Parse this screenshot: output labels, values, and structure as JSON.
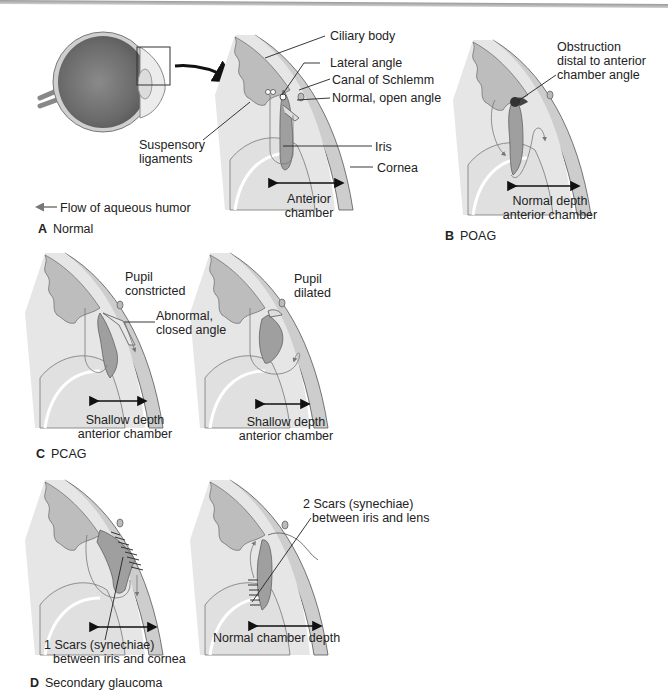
{
  "figure": {
    "panels": [
      {
        "letter": "A",
        "title": "Normal",
        "labels": {
          "ciliary_body": "Ciliary body",
          "lateral_angle": "Lateral angle",
          "canal_of_schlemm": "Canal of Schlemm",
          "normal_open_angle": "Normal, open angle",
          "suspensory_ligaments_1": "Suspensory",
          "suspensory_ligaments_2": "ligaments",
          "iris": "Iris",
          "cornea": "Cornea",
          "anterior_chamber_1": "Anterior",
          "anterior_chamber_2": "chamber"
        },
        "legend": "Flow of aqueous humor"
      },
      {
        "letter": "B",
        "title": "POAG",
        "labels": {
          "obstruction_1": "Obstruction",
          "obstruction_2": "distal to anterior",
          "obstruction_3": "chamber angle",
          "depth_1": "Normal depth",
          "depth_2": "anterior chamber"
        }
      },
      {
        "letter": "C",
        "title": "PCAG",
        "labels": {
          "pupil_constricted_1": "Pupil",
          "pupil_constricted_2": "constricted",
          "closed_angle_1": "Abnormal,",
          "closed_angle_2": "closed angle",
          "shallow_left_1": "Shallow depth",
          "shallow_left_2": "anterior chamber",
          "pupil_dilated_1": "Pupil",
          "pupil_dilated_2": "dilated",
          "shallow_right_1": "Shallow depth",
          "shallow_right_2": "anterior chamber"
        }
      },
      {
        "letter": "D",
        "title": "Secondary glaucoma",
        "labels": {
          "scars1_1": "1 Scars (synechiae)",
          "scars1_2": "between iris and cornea",
          "scars2_1": "2 Scars (synechiae)",
          "scars2_2": "between iris and lens",
          "normal_depth": "Normal chamber depth"
        }
      }
    ],
    "colors": {
      "tissue": "#d9d9d9",
      "cornea": "#c8c8c8",
      "iris": "#9a9a9a",
      "lens": "#e6e6e6",
      "line": "#222222",
      "arrow_flow": "#777777"
    }
  }
}
